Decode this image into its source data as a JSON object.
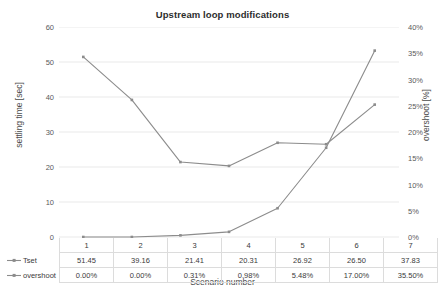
{
  "chart_data": {
    "type": "line",
    "title": "Upstream loop modifications",
    "xlabel": "Scenario number",
    "ylabel": "settling time [sec]",
    "y2label": "overshoot [%]",
    "categories": [
      "1",
      "2",
      "3",
      "4",
      "5",
      "6",
      "7"
    ],
    "grid": true,
    "legend_position": "data-table",
    "ylim": [
      0,
      60
    ],
    "y2lim": [
      0,
      0.4
    ],
    "yticks": [
      "0",
      "10",
      "20",
      "30",
      "40",
      "50",
      "60"
    ],
    "ytick_values": [
      0,
      10,
      20,
      30,
      40,
      50,
      60
    ],
    "y2ticks": [
      "0%",
      "5%",
      "10%",
      "15%",
      "20%",
      "25%",
      "30%",
      "35%",
      "40%"
    ],
    "y2tick_values": [
      0,
      0.05,
      0.1,
      0.15,
      0.2,
      0.25,
      0.3,
      0.35,
      0.4
    ],
    "series": [
      {
        "name": "Tset",
        "axis": "left",
        "color": "#8c8c8c",
        "marker": "square",
        "values": [
          51.45,
          39.16,
          21.41,
          20.31,
          26.92,
          26.5,
          37.83
        ],
        "labels": [
          "51.45",
          "39.16",
          "21.41",
          "20.31",
          "26.92",
          "26.50",
          "37.83"
        ]
      },
      {
        "name": "overshoot",
        "axis": "right",
        "color": "#8c8c8c",
        "marker": "square",
        "values": [
          0.0,
          0.0,
          0.0031,
          0.0098,
          0.0548,
          0.17,
          0.355
        ],
        "labels": [
          "0.00%",
          "0.00%",
          "0.31%",
          "0.98%",
          "5.48%",
          "17.00%",
          "35.50%"
        ]
      }
    ]
  }
}
